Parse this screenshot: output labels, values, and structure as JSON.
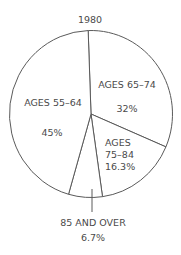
{
  "chart_data": {
    "type": "pie",
    "title": "1980",
    "start_angle_deg": -2,
    "direction": "clockwise",
    "slices": [
      {
        "label": "AGES 65–74",
        "value": 32,
        "value_label": "32%"
      },
      {
        "label": "AGES 75–84",
        "value": 16.3,
        "value_label": "16.3%"
      },
      {
        "label": "85 AND OVER",
        "value": 6.7,
        "value_label": "6.7%"
      },
      {
        "label": "AGES 55–64",
        "value": 45,
        "value_label": "45%"
      }
    ],
    "categories": [
      "AGES 65–74",
      "AGES 75–84",
      "85 AND OVER",
      "AGES 55–64"
    ],
    "values": [
      32,
      16.3,
      6.7,
      45
    ],
    "legend": "none (labels placed inside slices; smallest slice labelled below with a leader line)"
  },
  "labels": {
    "title": "1980",
    "s1_name": "AGES 65–74",
    "s1_pct": "32%",
    "s2_line1": "AGES",
    "s2_line2": "75–84",
    "s2_pct": "16.3%",
    "s3_name": "85 AND OVER",
    "s3_pct": "6.7%",
    "s4_name": "AGES 55–64",
    "s4_pct": "45%"
  },
  "style": {
    "stroke": "#5a5a5a",
    "text": "#4a4a4a",
    "background": "#ffffff"
  }
}
